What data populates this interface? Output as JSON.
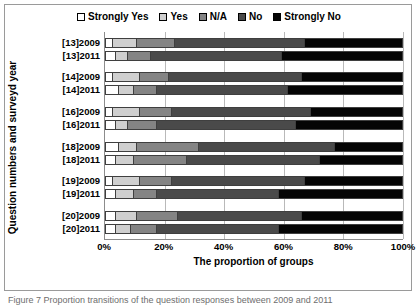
{
  "chart_data": {
    "type": "bar",
    "orientation": "horizontal",
    "stacked": true,
    "stacked_mode": "percent",
    "title": "",
    "xlabel": "The proportion of groups",
    "ylabel": "Question numbers and surveyd year",
    "xlim": [
      0,
      100
    ],
    "xtick_labels": [
      "0%",
      "20%",
      "40%",
      "60%",
      "80%",
      "100%"
    ],
    "xtick_values": [
      0,
      20,
      40,
      60,
      80,
      100
    ],
    "grid": true,
    "legend_position": "top",
    "categories": [
      "[13]2009",
      "[13]2011",
      "[14]2009",
      "[14]2011",
      "[16]2009",
      "[16]2011",
      "[18]2009",
      "[18]2011",
      "[19]2009",
      "[19]2011",
      "[20]2009",
      "[20]2011"
    ],
    "series": [
      {
        "name": "Strongly Yes",
        "color": "#ffffff",
        "values": [
          2,
          3,
          2,
          4,
          2,
          3,
          4,
          3,
          2,
          3,
          3,
          3
        ]
      },
      {
        "name": "Yes",
        "color": "#cfcfcf",
        "values": [
          8,
          4,
          9,
          5,
          9,
          4,
          6,
          6,
          9,
          6,
          7,
          5
        ]
      },
      {
        "name": "N/A",
        "color": "#848484",
        "values": [
          13,
          8,
          10,
          8,
          11,
          10,
          21,
          18,
          11,
          8,
          14,
          9
        ]
      },
      {
        "name": "No",
        "color": "#4a4a4a",
        "values": [
          44,
          44,
          45,
          44,
          47,
          47,
          46,
          45,
          45,
          41,
          42,
          41
        ]
      },
      {
        "name": "Strongly No",
        "color": "#050505",
        "values": [
          33,
          41,
          34,
          39,
          31,
          36,
          23,
          28,
          33,
          42,
          34,
          42
        ]
      }
    ],
    "cumulative_boundaries": [
      [
        2,
        10,
        23,
        67
      ],
      [
        3,
        7,
        15,
        59
      ],
      [
        2,
        11,
        21,
        66
      ],
      [
        4,
        9,
        17,
        61
      ],
      [
        2,
        11,
        22,
        69
      ],
      [
        3,
        7,
        17,
        64
      ],
      [
        4,
        10,
        31,
        77
      ],
      [
        3,
        9,
        27,
        72
      ],
      [
        2,
        11,
        22,
        67
      ],
      [
        3,
        9,
        17,
        58
      ],
      [
        3,
        10,
        24,
        66
      ],
      [
        3,
        8,
        17,
        58
      ]
    ],
    "groups": [
      {
        "label": "[13]",
        "rows": [
          0,
          1
        ]
      },
      {
        "label": "[14]",
        "rows": [
          2,
          3
        ]
      },
      {
        "label": "[16]",
        "rows": [
          4,
          5
        ]
      },
      {
        "label": "[18]",
        "rows": [
          6,
          7
        ]
      },
      {
        "label": "[19]",
        "rows": [
          8,
          9
        ]
      },
      {
        "label": "[20]",
        "rows": [
          10,
          11
        ]
      }
    ]
  },
  "legend": {
    "items": [
      {
        "label": "Strongly Yes",
        "color": "#ffffff"
      },
      {
        "label": "Yes",
        "color": "#cfcfcf"
      },
      {
        "label": "N/A",
        "color": "#848484"
      },
      {
        "label": "No",
        "color": "#4a4a4a"
      },
      {
        "label": "Strongly No",
        "color": "#050505"
      }
    ]
  },
  "caption": {
    "text": "Figure 7 Proportion transitions of the question responses between 2009 and 2011"
  }
}
